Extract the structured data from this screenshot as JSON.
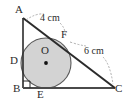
{
  "figure": {
    "vertices": [
      {
        "id": "A",
        "label": "A",
        "x": 23,
        "y": 18,
        "label_x": 16,
        "label_y": 4
      },
      {
        "id": "B",
        "label": "B",
        "x": 23,
        "y": 88,
        "label_x": 13,
        "label_y": 84
      },
      {
        "id": "C",
        "label": "C",
        "x": 115,
        "y": 88,
        "label_x": 115,
        "label_y": 84
      }
    ],
    "tangent_points": [
      {
        "id": "D",
        "label": "D",
        "x": 23,
        "y": 63,
        "label_x": 11,
        "label_y": 56
      },
      {
        "id": "E",
        "label": "E",
        "x": 46,
        "y": 88,
        "label_x": 37,
        "label_y": 89
      },
      {
        "id": "F",
        "label": "F",
        "x": 66,
        "y": 40,
        "label_x": 61,
        "label_y": 29
      }
    ],
    "center": {
      "id": "O",
      "label": "O",
      "x": 46,
      "y": 63,
      "label_x": 41,
      "label_y": 45
    },
    "circle": {
      "cx": 46,
      "cy": 63,
      "r": 25,
      "fill": "#d3d3d3",
      "stroke": "#555555"
    },
    "measurements": [
      {
        "id": "AF",
        "label": "4 cm",
        "x": 40,
        "y": 13
      },
      {
        "id": "FC",
        "label": "6 cm",
        "x": 83,
        "y": 46
      }
    ],
    "right_angle": {
      "at": "B",
      "x": 23,
      "y": 88,
      "size": 7
    },
    "colors": {
      "stroke": "#2b2b2b",
      "circle_fill": "#d3d3d3",
      "circle_stroke": "#5a5a5a",
      "leader": "#8a8a8a",
      "text": "#2b2b2b"
    }
  }
}
